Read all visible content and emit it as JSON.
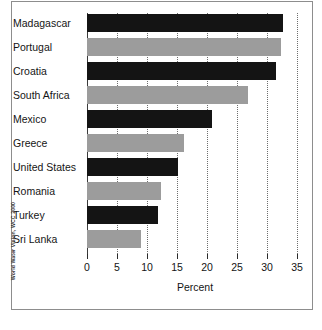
{
  "source_credit": "World Water Vision, WCC 2000",
  "chart_data": {
    "type": "bar",
    "orientation": "horizontal",
    "title": "",
    "xlabel": "Percent",
    "ylabel": "",
    "xlim": [
      0,
      36
    ],
    "xticks": [
      0,
      5,
      10,
      15,
      20,
      25,
      30,
      35
    ],
    "xtick_labels": [
      "0",
      "5",
      "10",
      "15",
      "20",
      "25",
      "30",
      "35"
    ],
    "grid": "vertical-dotted",
    "legend": "none",
    "categories": [
      "Madagascar",
      "Portugal",
      "Croatia",
      "South Africa",
      "Mexico",
      "Greece",
      "United States",
      "Romania",
      "Turkey",
      "Sri Lanka"
    ],
    "values": [
      32.7,
      32.3,
      31.5,
      26.8,
      20.8,
      16.2,
      15.2,
      12.3,
      11.8,
      9.0
    ],
    "bar_colors": [
      "#141414",
      "#9c9c9c",
      "#141414",
      "#9c9c9c",
      "#141414",
      "#9c9c9c",
      "#141414",
      "#9c9c9c",
      "#141414",
      "#9c9c9c"
    ],
    "colors": {
      "dark": "#141414",
      "light": "#9c9c9c",
      "axis": "#2b2b2b",
      "grid": "#6e6e6e",
      "frame": "#8d8d8d",
      "background": "#ffffff"
    }
  }
}
